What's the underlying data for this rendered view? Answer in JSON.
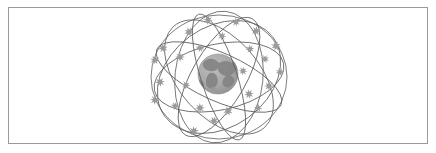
{
  "figure": {
    "caption": "",
    "background_color": "#ffffff",
    "border_color": "#9a9a9a",
    "alt_text": "Illustration of a globe of the Earth encircled by a lattice of crossing orbital rings with satellites positioned along them"
  },
  "illustration": {
    "title": "",
    "earth": {
      "label": "Earth",
      "center_x": 218,
      "center_y": 74,
      "radius": 20,
      "ocean_color": "#a7a7a7",
      "land_color": "#8a8a8a",
      "outline_color": "#8f8f8f"
    },
    "orbit_rings": {
      "label": "orbital rings",
      "count": 8,
      "stroke_color": "#5d5d5d",
      "stroke_width": 0.8,
      "center_x": 219,
      "center_y": 77,
      "radius_x": 68,
      "radius_y": 62,
      "rotations_deg": [
        0,
        24,
        48,
        72,
        96,
        120,
        144,
        168
      ]
    },
    "satellites": {
      "label": "satellites",
      "count": 26,
      "color": "#9b9b9b",
      "glyph": "asterisk-star",
      "positions": [
        {
          "x": 208,
          "y": 20,
          "size": 9,
          "rot": 12
        },
        {
          "x": 236,
          "y": 22,
          "size": 8,
          "rot": 40
        },
        {
          "x": 189,
          "y": 32,
          "size": 9,
          "rot": 25
        },
        {
          "x": 256,
          "y": 31,
          "size": 9,
          "rot": 55
        },
        {
          "x": 222,
          "y": 36,
          "size": 8,
          "rot": 8
        },
        {
          "x": 163,
          "y": 48,
          "size": 9,
          "rot": 30
        },
        {
          "x": 276,
          "y": 46,
          "size": 9,
          "rot": 18
        },
        {
          "x": 200,
          "y": 48,
          "size": 8,
          "rot": 60
        },
        {
          "x": 250,
          "y": 49,
          "size": 8,
          "rot": 35
        },
        {
          "x": 180,
          "y": 57,
          "size": 9,
          "rot": 44
        },
        {
          "x": 265,
          "y": 59,
          "size": 8,
          "rot": 22
        },
        {
          "x": 155,
          "y": 60,
          "size": 9,
          "rot": 15
        },
        {
          "x": 243,
          "y": 71,
          "size": 8,
          "rot": 50
        },
        {
          "x": 280,
          "y": 72,
          "size": 8,
          "rot": 28
        },
        {
          "x": 160,
          "y": 82,
          "size": 9,
          "rot": 38
        },
        {
          "x": 186,
          "y": 85,
          "size": 8,
          "rot": 10
        },
        {
          "x": 269,
          "y": 86,
          "size": 9,
          "rot": 46
        },
        {
          "x": 213,
          "y": 90,
          "size": 8,
          "rot": 20
        },
        {
          "x": 249,
          "y": 94,
          "size": 9,
          "rot": 33
        },
        {
          "x": 155,
          "y": 100,
          "size": 9,
          "rot": 52
        },
        {
          "x": 175,
          "y": 106,
          "size": 8,
          "rot": 16
        },
        {
          "x": 200,
          "y": 108,
          "size": 9,
          "rot": 42
        },
        {
          "x": 228,
          "y": 111,
          "size": 9,
          "rot": 26
        },
        {
          "x": 258,
          "y": 108,
          "size": 8,
          "rot": 58
        },
        {
          "x": 214,
          "y": 121,
          "size": 9,
          "rot": 14
        },
        {
          "x": 194,
          "y": 131,
          "size": 9,
          "rot": 36
        }
      ]
    }
  }
}
